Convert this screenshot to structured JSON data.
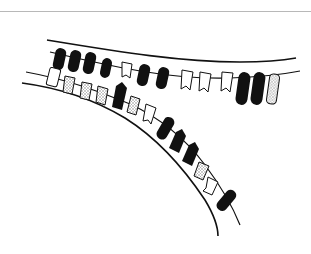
{
  "figure": {
    "colors": {
      "ink": "#111111",
      "dark_element": "#111111",
      "light_element": "#ffffff",
      "stippled_element": "#cfcfcf",
      "top_rule": "#b8b8b8",
      "background": "#ffffff"
    },
    "upper_strand": {
      "elements": [
        "dark",
        "dark",
        "dark",
        "dark",
        "notched",
        "dark",
        "dark",
        "notched",
        "notched",
        "notched",
        "dark",
        "dark",
        "stippled"
      ]
    },
    "lower_strand_top_row": {
      "elements": [
        "light",
        "stippled",
        "stippled",
        "stippled",
        "dark-arrow",
        "stippled",
        "notched"
      ]
    },
    "lower_strand": {
      "elements": [
        "dark",
        "dark-arrow",
        "dark-arrow",
        "stippled-notched",
        "notched",
        "dark"
      ]
    }
  }
}
